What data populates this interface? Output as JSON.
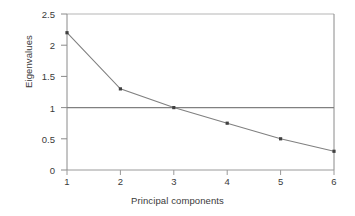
{
  "chart_data": {
    "type": "line",
    "title": "",
    "subtitle": "",
    "xlabel": "Principal components",
    "ylabel": "Eigenvalues",
    "x": [
      1,
      2,
      3,
      4,
      5,
      6
    ],
    "categories": [
      "1",
      "2",
      "3",
      "4",
      "5",
      "6"
    ],
    "values": [
      2.2,
      1.3,
      1.0,
      0.75,
      0.5,
      0.3
    ],
    "series": [
      {
        "name": "Eigenvalues",
        "values": [
          2.2,
          1.3,
          1.0,
          0.75,
          0.5,
          0.3
        ]
      }
    ],
    "xlim": [
      1,
      6
    ],
    "ylim": [
      0,
      2.5
    ],
    "xticks": [
      "1",
      "2",
      "3",
      "4",
      "5",
      "6"
    ],
    "yticks": [
      "0",
      "0.5",
      "1",
      "1.5",
      "2",
      "2.5"
    ],
    "ytick_values": [
      0,
      0.5,
      1,
      1.5,
      2,
      2.5
    ],
    "grid": false,
    "legend": "none",
    "annotations": [
      {
        "type": "hline",
        "name": "kaiser-criterion-line",
        "y": 1,
        "label": ""
      }
    ],
    "marker": "square",
    "colors": {
      "line": "#808080",
      "marker": "#404040",
      "frame": "#999999",
      "reference_line": "#808080",
      "text": "#3a3a3a",
      "background": "#ffffff"
    }
  }
}
